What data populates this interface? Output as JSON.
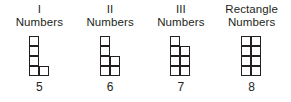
{
  "diagram": {
    "type": "figurate-number-grids",
    "columns": [
      {
        "caption_line_1": "I",
        "caption_line_2": "Numbers",
        "count": "5",
        "grid": {
          "cols": 2,
          "rows": 4,
          "filled": [
            [
              true,
              false
            ],
            [
              true,
              false
            ],
            [
              true,
              false
            ],
            [
              true,
              true
            ]
          ]
        }
      },
      {
        "caption_line_1": "II",
        "caption_line_2": "Numbers",
        "count": "6",
        "grid": {
          "cols": 2,
          "rows": 4,
          "filled": [
            [
              true,
              false
            ],
            [
              true,
              false
            ],
            [
              true,
              true
            ],
            [
              true,
              true
            ]
          ]
        }
      },
      {
        "caption_line_1": "III",
        "caption_line_2": "Numbers",
        "count": "7",
        "grid": {
          "cols": 2,
          "rows": 4,
          "filled": [
            [
              true,
              false
            ],
            [
              true,
              true
            ],
            [
              true,
              true
            ],
            [
              true,
              true
            ]
          ]
        }
      },
      {
        "caption_line_1": "Rectangle",
        "caption_line_2": "Numbers",
        "count": "8",
        "grid": {
          "cols": 2,
          "rows": 4,
          "filled": [
            [
              true,
              true
            ],
            [
              true,
              true
            ],
            [
              true,
              true
            ],
            [
              true,
              true
            ]
          ]
        }
      }
    ],
    "colors": {
      "ink": "#231f20",
      "cell_fill": "#ffffff",
      "background": "#ffffff"
    }
  }
}
